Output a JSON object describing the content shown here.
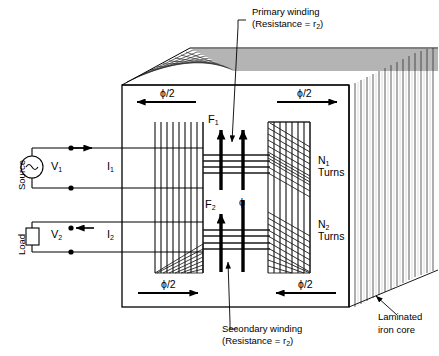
{
  "figure": {
    "type": "engineering-cutaway-diagram",
    "background": "#ffffff",
    "stroke": "#000000",
    "lamination_fill": "#ffffff",
    "width": 439,
    "height": 356
  },
  "callouts": {
    "primary": {
      "line1": "Primary winding",
      "line2_pre": "(Resistance = r",
      "line2_sub": "2",
      "line2_post": ")"
    },
    "secondary": {
      "line1": "Secondary winding",
      "line2_pre": "(Resistance = r",
      "line2_sub": "2",
      "line2_post": ")"
    },
    "core": {
      "line1": "Laminated",
      "line2": "iron core"
    }
  },
  "circuit": {
    "source_label": "Source",
    "load_label": "Load",
    "source_voltage_pre": "V",
    "source_voltage_sub": "1",
    "load_voltage_pre": "V",
    "load_voltage_sub": "2",
    "primary_current_pre": "I",
    "primary_current_sub": "1",
    "secondary_current_pre": "I",
    "secondary_current_sub": "2",
    "source_symbol": "ac-source-icon",
    "load_symbol": "resistor-icon"
  },
  "windings": {
    "primary_turns_pre": "N",
    "primary_turns_sub": "1",
    "primary_turns_word": "Turns",
    "secondary_turns_pre": "N",
    "secondary_turns_sub": "2",
    "secondary_turns_word": "Turns"
  },
  "flux": {
    "main_symbol": "ϕ",
    "half_symbol": "ϕ/2",
    "arrows": [
      {
        "name": "flux-half-top-left",
        "direction": "left"
      },
      {
        "name": "flux-half-top-right",
        "direction": "right"
      },
      {
        "name": "flux-half-bottom-left",
        "direction": "right"
      },
      {
        "name": "flux-half-bottom-right",
        "direction": "left"
      }
    ]
  },
  "mmf": {
    "primary_pre": "F",
    "primary_sub": "1",
    "secondary_pre": "F",
    "secondary_sub": "2"
  }
}
